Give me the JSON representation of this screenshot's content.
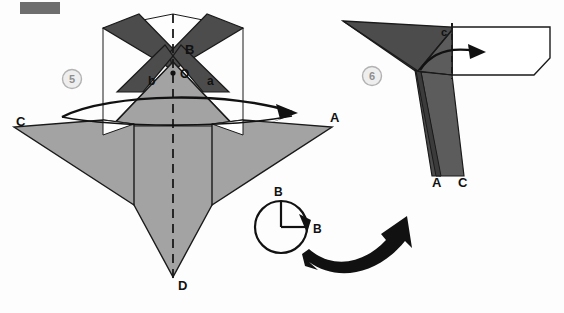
{
  "page": {
    "width": 564,
    "height": 313,
    "background": "#fdfdfd",
    "type": "origami-instruction-diagram"
  },
  "colors": {
    "paper_light": "#a3a3a3",
    "paper_dark": "#4c4c4c",
    "paper_mid": "#5c5c5c",
    "paper_white": "#ffffff",
    "outline": "#1a1a1a",
    "arrow_black": "#111111",
    "step_badge_fill": "#eeeeee",
    "step_badge_stroke": "#b2b2b2",
    "step_badge_text": "#8e8e8e",
    "crop_mark": "#6e6e6e"
  },
  "artifacts": {
    "crop_mark_label": "crop-mark-bar"
  },
  "steps": [
    {
      "id": "step-5",
      "number": "5",
      "badge_x": 72,
      "badge_y": 79,
      "labels": [
        {
          "name": "label-B",
          "text": "B",
          "x": 185,
          "y": 54,
          "size": "lbl-big"
        },
        {
          "name": "label-O",
          "text": "O",
          "x": 180,
          "y": 78,
          "size": "lbl-mid"
        },
        {
          "name": "label-b",
          "text": "b",
          "x": 148,
          "y": 85,
          "size": "lbl-mid"
        },
        {
          "name": "label-a",
          "text": "a",
          "x": 207,
          "y": 85,
          "size": "lbl-mid"
        },
        {
          "name": "label-C",
          "text": "C",
          "x": 16,
          "y": 126,
          "size": "lbl-big"
        },
        {
          "name": "label-A",
          "text": "A",
          "x": 330,
          "y": 122,
          "size": "lbl-big"
        },
        {
          "name": "label-D",
          "text": "D",
          "x": 178,
          "y": 290,
          "size": "lbl-big"
        }
      ]
    },
    {
      "id": "step-6",
      "number": "6",
      "badge_x": 372,
      "badge_y": 76,
      "labels": [
        {
          "name": "label-c",
          "text": "c",
          "x": 441,
          "y": 36,
          "size": "lbl-sm"
        },
        {
          "name": "label-A",
          "text": "A",
          "x": 437,
          "y": 184,
          "size": "lbl-big"
        },
        {
          "name": "label-C",
          "text": "C",
          "x": 461,
          "y": 184,
          "size": "lbl-big"
        }
      ]
    }
  ],
  "rotation_symbol": {
    "name": "rotate-90-symbol",
    "center_x": 281,
    "center_y": 227,
    "radius": 26,
    "labels": [
      {
        "name": "rotation-label-top",
        "text": "B",
        "x": 274,
        "y": 196
      },
      {
        "name": "rotation-label-right",
        "text": "B",
        "x": 313,
        "y": 233
      }
    ]
  },
  "transition_arrow": {
    "name": "large-curved-arrow",
    "description": "large black curved arrow pointing up-right between step 5 and step 6"
  },
  "fold_arrows": [
    {
      "name": "fold-arrow-step5",
      "description": "wide flat curved arrow across step 5 pointing right toward A"
    },
    {
      "name": "fold-arrow-step6",
      "description": "curved arrow in step 6 pointing right into the white flap"
    }
  ]
}
